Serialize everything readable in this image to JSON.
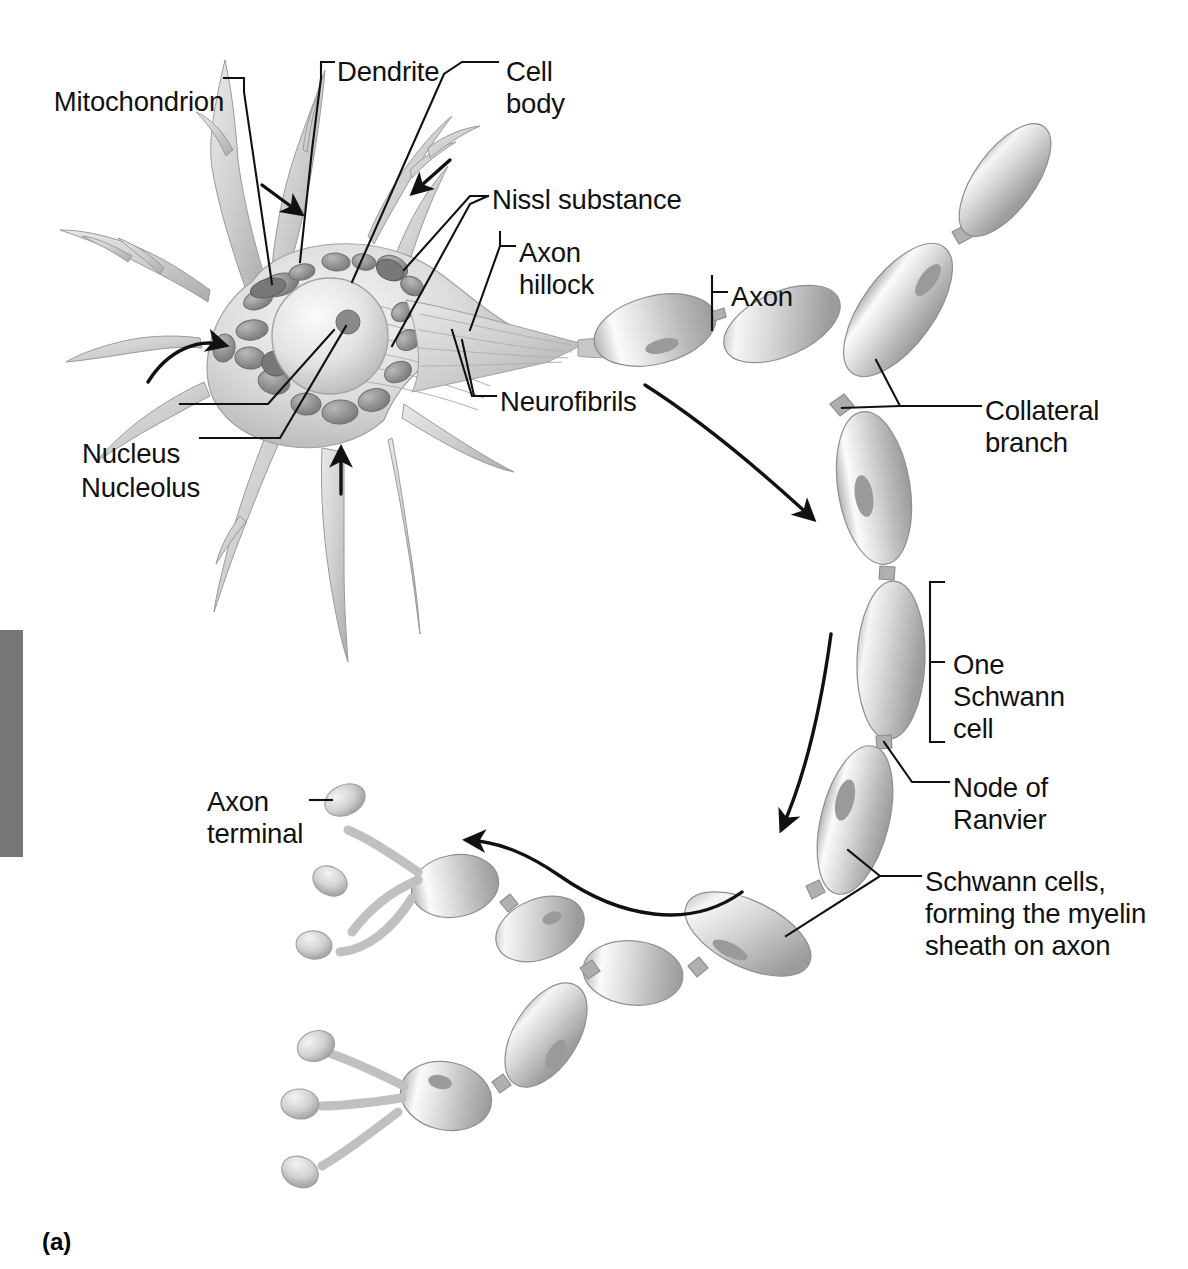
{
  "figure": {
    "caption": "(a)",
    "style": {
      "background": "#ffffff",
      "ink": "#111111",
      "cell_light": "#f2f2f2",
      "cell_mid": "#c9c9c9",
      "cell_dark": "#8d8d8d",
      "organelle_dark": "#6f6f6f",
      "gray_bar": "#767676"
    },
    "gray_bar": {
      "x": 0,
      "y": 630,
      "width": 23,
      "height": 227
    }
  },
  "labels": [
    {
      "id": "mitochondrion",
      "text": "Mitochondrion",
      "lines": [
        "Mitochondrion"
      ],
      "align": "right",
      "x": 52,
      "y": 86
    },
    {
      "id": "dendrite",
      "text": "Dendrite",
      "lines": [
        "Dendrite"
      ],
      "align": "left",
      "x": 337,
      "y": 56
    },
    {
      "id": "cell-body",
      "text": "Cell body",
      "lines": [
        "Cell",
        "body"
      ],
      "align": "left",
      "x": 506,
      "y": 56
    },
    {
      "id": "nissl-substance",
      "text": "Nissl substance",
      "lines": [
        "Nissl substance"
      ],
      "align": "left",
      "x": 492,
      "y": 184
    },
    {
      "id": "axon-hillock",
      "text": "Axon hillock",
      "lines": [
        "Axon",
        "hillock"
      ],
      "align": "left",
      "x": 519,
      "y": 237
    },
    {
      "id": "axon",
      "text": "Axon",
      "lines": [
        "Axon"
      ],
      "align": "left",
      "x": 731,
      "y": 281
    },
    {
      "id": "collateral-branch",
      "text": "Collateral branch",
      "lines": [
        "Collateral",
        "branch"
      ],
      "align": "left",
      "x": 985,
      "y": 395
    },
    {
      "id": "neurofibrils",
      "text": "Neurofibrils",
      "lines": [
        "Neurofibrils"
      ],
      "align": "left",
      "x": 500,
      "y": 386
    },
    {
      "id": "nucleus",
      "text": "Nucleus",
      "lines": [
        "Nucleus"
      ],
      "align": "right",
      "x": 52,
      "y": 438
    },
    {
      "id": "nucleolus",
      "text": "Nucleolus",
      "lines": [
        "Nucleolus"
      ],
      "align": "right",
      "x": 52,
      "y": 472
    },
    {
      "id": "one-schwann-cell",
      "text": "One Schwann cell",
      "lines": [
        "One",
        "Schwann",
        "cell"
      ],
      "align": "left",
      "x": 953,
      "y": 649
    },
    {
      "id": "node-of-ranvier",
      "text": "Node of Ranvier",
      "lines": [
        "Node of",
        "Ranvier"
      ],
      "align": "left",
      "x": 953,
      "y": 772
    },
    {
      "id": "axon-terminal",
      "text": "Axon terminal",
      "lines": [
        "Axon",
        "terminal"
      ],
      "align": "left",
      "x": 207,
      "y": 786
    },
    {
      "id": "schwann-myelin",
      "text": "Schwann cells, forming the myelin sheath on axon",
      "lines": [
        "Schwann cells,",
        "forming the myelin",
        "sheath on axon"
      ],
      "align": "left",
      "x": 925,
      "y": 866
    }
  ],
  "flow_arrows": [
    {
      "id": "arrow-dendrite-left",
      "description": "impulse toward soma, upper-left dendrite"
    },
    {
      "id": "arrow-dendrite-right",
      "description": "impulse toward soma, upper-right dendrite"
    },
    {
      "id": "arrow-soma-curved-left",
      "description": "curved impulse sweep into soma from left"
    },
    {
      "id": "arrow-dendrite-bottom",
      "description": "impulse up the lower dendrite"
    },
    {
      "id": "arrow-axon-upper",
      "description": "conduction down the axon, upper bend"
    },
    {
      "id": "arrow-axon-lower",
      "description": "conduction down the axon, lower bend"
    },
    {
      "id": "arrow-terminal",
      "description": "conduction toward axon terminals"
    }
  ]
}
